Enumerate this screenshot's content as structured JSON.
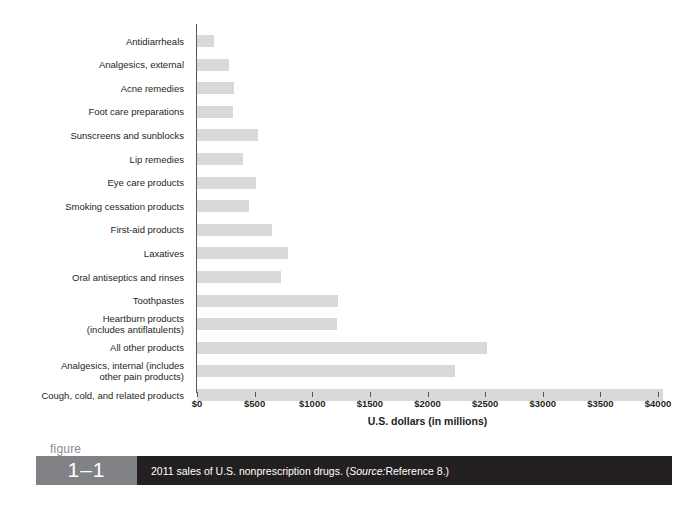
{
  "figure": {
    "label_word": "figure",
    "number": "1–1",
    "caption_prefix": "2011 sales of U.S. nonprescription drugs. (",
    "caption_source_italic": "Source:",
    "caption_suffix": " Reference 8.)"
  },
  "chart_data": {
    "type": "bar",
    "orientation": "horizontal",
    "title": "2011 sales of U.S. nonprescription drugs",
    "xlabel": "U.S. dollars (in millions)",
    "ylabel": "",
    "xlim": [
      0,
      4000
    ],
    "xticks": [
      0,
      500,
      1000,
      1500,
      2000,
      2500,
      3000,
      3500,
      4000
    ],
    "xticklabels": [
      "$0",
      "$500",
      "$1000",
      "$1500",
      "$2000",
      "$2500",
      "$3000",
      "$3500",
      "$4000"
    ],
    "grid": false,
    "legend": false,
    "bar_color": "#d9d9d9",
    "axis_color": "#58595b",
    "units": "millions of U.S. dollars",
    "categories": [
      "Antidiarrheals",
      "Analgesics, external",
      "Acne remedies",
      "Foot care preparations",
      "Sunscreens and sunblocks",
      "Lip remedies",
      "Eye care products",
      "Smoking cessation products",
      "First-aid products",
      "Laxatives",
      "Oral antiseptics and rinses",
      "Toothpastes",
      "Heartburn products\n(includes antiflatulents)",
      "All other products",
      "Analgesics, internal (includes\nother pain products)",
      "Cough, cold, and related products"
    ],
    "values": [
      150,
      280,
      320,
      310,
      530,
      400,
      510,
      450,
      650,
      790,
      730,
      1225,
      1215,
      2515,
      2240,
      4040
    ]
  }
}
